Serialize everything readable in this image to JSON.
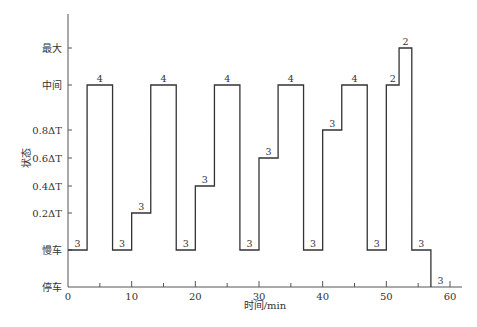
{
  "chart_data": {
    "type": "line",
    "subtype": "step",
    "title": "",
    "xlabel": "时间/min",
    "ylabel": "状态",
    "xlim": [
      0,
      60
    ],
    "x_ticks": [
      0,
      10,
      20,
      30,
      40,
      50,
      60
    ],
    "x_minor_ticks": [
      5,
      15,
      25,
      35,
      45,
      55
    ],
    "y_levels": [
      {
        "key": "stop",
        "label": "停车",
        "y": 287
      },
      {
        "key": "idle",
        "label": "慢车",
        "y": 250
      },
      {
        "key": "p02",
        "label": "0.2ΔT",
        "y": 213
      },
      {
        "key": "p04",
        "label": "0.4ΔT",
        "y": 186
      },
      {
        "key": "p06",
        "label": "0.6ΔT",
        "y": 158
      },
      {
        "key": "p08",
        "label": "0.8ΔT",
        "y": 130
      },
      {
        "key": "mid",
        "label": "中间",
        "y": 85
      },
      {
        "key": "max",
        "label": "最大",
        "y": 48
      }
    ],
    "segments": [
      {
        "start": 0,
        "end": 3,
        "level": "idle",
        "label": "3"
      },
      {
        "start": 3,
        "end": 7,
        "level": "mid",
        "label": "4"
      },
      {
        "start": 7,
        "end": 10,
        "level": "idle",
        "label": "3"
      },
      {
        "start": 10,
        "end": 13,
        "level": "p02",
        "label": "3"
      },
      {
        "start": 13,
        "end": 17,
        "level": "mid",
        "label": "4"
      },
      {
        "start": 17,
        "end": 20,
        "level": "idle",
        "label": "3"
      },
      {
        "start": 20,
        "end": 23,
        "level": "p04",
        "label": "3"
      },
      {
        "start": 23,
        "end": 27,
        "level": "mid",
        "label": "4"
      },
      {
        "start": 27,
        "end": 30,
        "level": "idle",
        "label": "3"
      },
      {
        "start": 30,
        "end": 33,
        "level": "p06",
        "label": "3"
      },
      {
        "start": 33,
        "end": 37,
        "level": "mid",
        "label": "4"
      },
      {
        "start": 37,
        "end": 40,
        "level": "idle",
        "label": "3"
      },
      {
        "start": 40,
        "end": 43,
        "level": "p08",
        "label": "3"
      },
      {
        "start": 43,
        "end": 47,
        "level": "mid",
        "label": "4"
      },
      {
        "start": 47,
        "end": 50,
        "level": "idle",
        "label": "3"
      },
      {
        "start": 50,
        "end": 52,
        "level": "mid",
        "label": "2"
      },
      {
        "start": 52,
        "end": 54,
        "level": "max",
        "label": "2"
      },
      {
        "start": 54,
        "end": 57,
        "level": "idle",
        "label": "3"
      },
      {
        "start": 57,
        "end": 60,
        "level": "stop",
        "label": "3"
      }
    ],
    "grid": false,
    "legend": null
  }
}
